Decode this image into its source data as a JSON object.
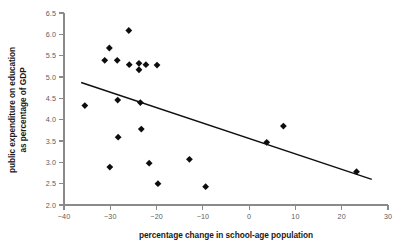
{
  "chart_data": {
    "type": "scatter",
    "title": "",
    "xlabel": "percentage change in school-age population",
    "ylabel": "public expenditure on education as percentage of GDP",
    "ylabel_line1": "public expenditure on education",
    "ylabel_line2": "as percentage of GDP",
    "xlim": [
      -40,
      30
    ],
    "ylim": [
      2.0,
      6.5
    ],
    "xticks": [
      -40,
      -30,
      -20,
      -10,
      0,
      10,
      20,
      30
    ],
    "xtick_labels": [
      "−40",
      "−30",
      "−20",
      "−10",
      "0",
      "10",
      "20",
      "30"
    ],
    "yticks": [
      2.0,
      2.5,
      3.0,
      3.5,
      4.0,
      4.5,
      5.0,
      5.5,
      6.0,
      6.5
    ],
    "ytick_labels": [
      "2.0",
      "2.5",
      "3.0",
      "3.5",
      "4.0",
      "4.5",
      "5.0",
      "5.5",
      "6.0",
      "6.5"
    ],
    "grid": false,
    "legend": null,
    "marker": "diamond",
    "marker_color": "#0d0d0d",
    "points": [
      {
        "x": -35.5,
        "y": 4.33
      },
      {
        "x": -31.2,
        "y": 5.39
      },
      {
        "x": -30.2,
        "y": 5.68
      },
      {
        "x": -30.1,
        "y": 2.89
      },
      {
        "x": -28.5,
        "y": 5.39
      },
      {
        "x": -28.4,
        "y": 4.46
      },
      {
        "x": -28.3,
        "y": 3.59
      },
      {
        "x": -26.0,
        "y": 6.09
      },
      {
        "x": -25.9,
        "y": 5.29
      },
      {
        "x": -23.8,
        "y": 5.32
      },
      {
        "x": -23.8,
        "y": 5.17
      },
      {
        "x": -23.5,
        "y": 4.4
      },
      {
        "x": -23.3,
        "y": 3.78
      },
      {
        "x": -22.3,
        "y": 5.29
      },
      {
        "x": -21.6,
        "y": 2.98
      },
      {
        "x": -19.9,
        "y": 5.28
      },
      {
        "x": -19.7,
        "y": 2.5
      },
      {
        "x": -12.9,
        "y": 3.07
      },
      {
        "x": -9.4,
        "y": 2.43
      },
      {
        "x": 3.8,
        "y": 3.47
      },
      {
        "x": 7.4,
        "y": 3.85
      },
      {
        "x": 23.2,
        "y": 2.78
      }
    ],
    "trend_line": {
      "type": "linear-fit",
      "x_start": -36.3,
      "y_start": 4.87,
      "x_end": 26.5,
      "y_end": 2.6,
      "color": "#111111"
    }
  }
}
